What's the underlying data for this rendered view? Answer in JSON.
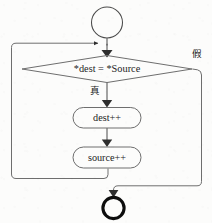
{
  "diagram": {
    "type": "flowchart",
    "language": "zh-Hans",
    "colors": {
      "stroke": "#3a3a3a",
      "text": "#1a1a1a",
      "background": "#fcfcfb",
      "terminator_end_stroke": "#0d0d0d"
    },
    "nodes": {
      "start": {
        "label": "",
        "shape": "circle",
        "role": "start-terminator"
      },
      "decision": {
        "label": "*dest = *Source",
        "shape": "diamond",
        "role": "condition"
      },
      "process_dest": {
        "label": "dest++",
        "shape": "rounded-rectangle",
        "role": "process"
      },
      "process_source": {
        "label": "source++",
        "shape": "rounded-rectangle",
        "role": "process"
      },
      "end": {
        "label": "",
        "shape": "bold-circle",
        "role": "end-terminator"
      }
    },
    "edge_labels": {
      "true_branch": "真",
      "false_branch": "假"
    }
  }
}
